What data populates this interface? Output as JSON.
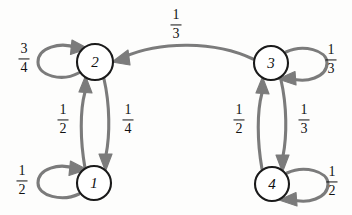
{
  "diagram": {
    "edge_color": "#7b7b7b",
    "node_stroke_color": "#1a1a1a",
    "node_fill_color": "#ffffff",
    "background_color": "#fdfdfc",
    "nodes": [
      {
        "id": "1",
        "label": "1",
        "x": 94,
        "y": 183,
        "r": 17
      },
      {
        "id": "2",
        "label": "2",
        "x": 95,
        "y": 62,
        "r": 18
      },
      {
        "id": "3",
        "label": "3",
        "x": 271,
        "y": 63,
        "r": 17
      },
      {
        "id": "4",
        "label": "4",
        "x": 272,
        "y": 184,
        "r": 17
      }
    ],
    "edges": [
      {
        "from": "2",
        "to": "2",
        "kind": "self-loop",
        "side": "left",
        "numerator": "3",
        "denominator": "4",
        "label_x": 24,
        "label_y": 59
      },
      {
        "from": "1",
        "to": "1",
        "kind": "self-loop",
        "side": "left",
        "numerator": "1",
        "denominator": "2",
        "label_x": 22,
        "label_y": 181
      },
      {
        "from": "3",
        "to": "3",
        "kind": "self-loop",
        "side": "right",
        "numerator": "1",
        "denominator": "3",
        "label_x": 331,
        "label_y": 60
      },
      {
        "from": "4",
        "to": "4",
        "kind": "self-loop",
        "side": "right",
        "numerator": "1",
        "denominator": "2",
        "label_x": 332,
        "label_y": 182
      },
      {
        "from": "3",
        "to": "2",
        "kind": "curve",
        "side": "top",
        "numerator": "1",
        "denominator": "3",
        "label_x": 176,
        "label_y": 25
      },
      {
        "from": "1",
        "to": "2",
        "kind": "vertical",
        "side": "left",
        "numerator": "1",
        "denominator": "2",
        "label_x": 63,
        "label_y": 120
      },
      {
        "from": "2",
        "to": "1",
        "kind": "vertical",
        "side": "right",
        "numerator": "1",
        "denominator": "4",
        "label_x": 128,
        "label_y": 120
      },
      {
        "from": "4",
        "to": "3",
        "kind": "vertical",
        "side": "left",
        "numerator": "1",
        "denominator": "2",
        "label_x": 239,
        "label_y": 120
      },
      {
        "from": "3",
        "to": "4",
        "kind": "vertical",
        "side": "right",
        "numerator": "1",
        "denominator": "3",
        "label_x": 304,
        "label_y": 120
      }
    ]
  }
}
